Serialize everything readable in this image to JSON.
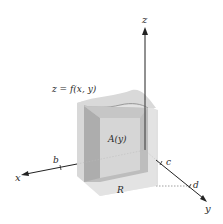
{
  "figure": {
    "surface_label": "z = f(x, y)",
    "cross_section_label": "A(y)",
    "region_label": "R",
    "axes": {
      "x": "x",
      "y": "y",
      "z": "z"
    },
    "ticks": {
      "b": "b",
      "c": "c",
      "d": "d"
    },
    "colors": {
      "axis": "#222222",
      "panel_light": "#e6e6e6",
      "panel_mid": "#cfcfcf",
      "panel_dark": "#b5b5b5",
      "region": "#eeeeee"
    }
  }
}
